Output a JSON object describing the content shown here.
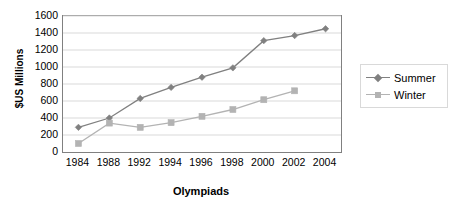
{
  "chart_data": {
    "type": "line",
    "title": "",
    "xlabel": "Olympiads",
    "ylabel": "$US Millions",
    "categories": [
      "1984",
      "1988",
      "1992",
      "1994",
      "1996",
      "1998",
      "2000",
      "2002",
      "2004"
    ],
    "series": [
      {
        "name": "Summer",
        "color": "#808080",
        "marker": "diamond",
        "values": [
          290,
          400,
          630,
          760,
          880,
          990,
          1310,
          1370,
          1450
        ]
      },
      {
        "name": "Winter",
        "color": "#b3b3b3",
        "marker": "square",
        "values": [
          100,
          340,
          290,
          345,
          420,
          500,
          615,
          720,
          null
        ]
      }
    ],
    "ylim": [
      0,
      1600
    ],
    "y_ticks": [
      "1600",
      "1400",
      "1200",
      "1000",
      "800",
      "600",
      "400",
      "200",
      "0"
    ],
    "y_tick_values": [
      1600,
      1400,
      1200,
      1000,
      800,
      600,
      400,
      200,
      0
    ],
    "grid": "horizontal",
    "legend_position": "right",
    "legend_entries": [
      "Summer",
      "Winter"
    ]
  },
  "axes": {
    "y_title": "$US Millions",
    "x_title": "Olympiads"
  },
  "colors": {
    "summer": "#808080",
    "winter": "#b3b3b3",
    "gridline": "#d9d9d9",
    "axis_border": "#808080",
    "background": "#ffffff",
    "text": "#000000"
  }
}
